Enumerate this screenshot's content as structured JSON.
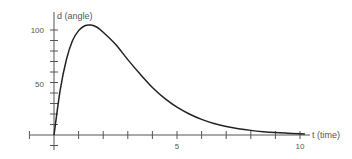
{
  "chart_data": {
    "type": "line",
    "title": "",
    "xlabel": "t (time)",
    "ylabel": "d (angle)",
    "x_ticks": [
      1,
      2,
      3,
      4,
      5,
      6,
      7,
      8,
      9,
      10
    ],
    "x_tick_labels": {
      "5": "5",
      "10": "10"
    },
    "y_ticks": [
      10,
      20,
      30,
      40,
      50,
      60,
      70,
      80,
      90,
      100
    ],
    "y_tick_labels": {
      "50": "50",
      "100": "100"
    },
    "xlim": [
      -1,
      10.5
    ],
    "ylim": [
      -10,
      115
    ],
    "grid": false,
    "legend": null,
    "series": [
      {
        "name": "d(t)",
        "color": "#222222",
        "x": [
          0,
          0.25,
          0.5,
          0.75,
          1.0,
          1.25,
          1.5,
          1.75,
          2.0,
          2.5,
          3.0,
          3.5,
          4.0,
          4.5,
          5.0,
          5.5,
          6.0,
          6.5,
          7.0,
          7.5,
          8.0,
          8.5,
          9.0,
          9.5,
          10.0,
          10.2
        ],
        "y": [
          0,
          42.6,
          71.4,
          89.7,
          99.4,
          104.1,
          104.7,
          102.6,
          97.9,
          86.4,
          71.8,
          58.0,
          45.3,
          34.9,
          26.5,
          20.0,
          14.9,
          11.0,
          8.1,
          6.0,
          4.4,
          3.2,
          2.3,
          1.7,
          1.2,
          1.0
        ]
      }
    ]
  },
  "axes": {
    "x_label": "t (time)",
    "y_label": "d (angle)",
    "x_tick_5": "5",
    "x_tick_10": "10",
    "y_tick_50": "50",
    "y_tick_100": "100"
  }
}
